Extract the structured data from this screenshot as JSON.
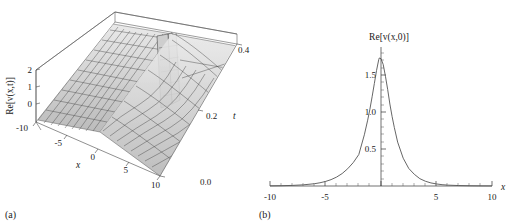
{
  "figure": {
    "panels": [
      {
        "caption": "(a)",
        "type": "surface3d",
        "zlabel": "Re[v(x,t)]",
        "xlabel": "x",
        "ylabel": "t"
      },
      {
        "caption": "(b)",
        "type": "line",
        "title": "Re[v(x,0)]",
        "xlabel": "x"
      }
    ]
  },
  "chart_data": [
    {
      "type": "surface",
      "title": "",
      "zlabel": "Re[v(x,t)]",
      "xlabel": "x",
      "ylabel": "t",
      "xticks": [
        -10,
        -5,
        0,
        5,
        10
      ],
      "xtick_labels": [
        "-10",
        "-5",
        "0",
        "5",
        "10"
      ],
      "yticks": [
        0.0,
        0.2,
        0.4
      ],
      "ytick_labels": [
        "0.0",
        "0.2",
        "0.4"
      ],
      "zticks": [
        0,
        1,
        2
      ],
      "ztick_labels": [
        "0",
        "1",
        "2"
      ],
      "xlim": [
        -10,
        10
      ],
      "ylim": [
        0.0,
        0.5
      ],
      "zlim": [
        -0.5,
        2.5
      ],
      "grid": true,
      "description": "Mesh surface of Re[v(x,t)] showing a flat plateau for x<0 that develops a singular spike near x=0 growing with t, then a trough and recovery for x>0",
      "spike": {
        "x": 0,
        "t": 0.45,
        "height": 2.6
      },
      "series": [
        {
          "name": "Re[v(x,t)]",
          "note": "grey-shaded mesh surface"
        }
      ]
    },
    {
      "type": "line",
      "title": "Re[v(x,0)]",
      "xlabel": "x",
      "ylabel": "",
      "xlim": [
        -10,
        10
      ],
      "ylim": [
        0,
        1.9
      ],
      "xticks": [
        -10,
        -5,
        5,
        10
      ],
      "xtick_labels": [
        "-10",
        "-5",
        "5",
        "10"
      ],
      "yticks": [
        0.5,
        1.0,
        1.5
      ],
      "ytick_labels": [
        "0.5",
        "1.0",
        "1.5"
      ],
      "grid": false,
      "peak": {
        "x": -0.15,
        "y": 1.75
      },
      "x": [
        -10,
        -9,
        -8,
        -7,
        -6,
        -5.5,
        -5,
        -4.5,
        -4,
        -3.5,
        -3,
        -2.5,
        -2,
        -1.5,
        -1.2,
        -1,
        -0.8,
        -0.6,
        -0.4,
        -0.2,
        -0.15,
        0,
        0.2,
        0.4,
        0.6,
        0.8,
        1,
        1.2,
        1.5,
        2,
        2.5,
        3,
        3.5,
        4,
        4.5,
        5,
        5.5,
        6,
        7,
        8,
        9,
        10
      ],
      "values": [
        0.002,
        0.004,
        0.008,
        0.016,
        0.031,
        0.044,
        0.062,
        0.087,
        0.122,
        0.17,
        0.236,
        0.32,
        0.43,
        0.7,
        0.9,
        1.05,
        1.22,
        1.4,
        1.58,
        1.73,
        1.75,
        1.74,
        1.66,
        1.5,
        1.32,
        1.12,
        0.95,
        0.8,
        0.6,
        0.38,
        0.24,
        0.16,
        0.1,
        0.065,
        0.042,
        0.028,
        0.018,
        0.012,
        0.006,
        0.003,
        0.0015,
        0.001
      ],
      "series": [
        {
          "name": "Re[v(x,0)]",
          "color": "#555555"
        }
      ]
    }
  ]
}
